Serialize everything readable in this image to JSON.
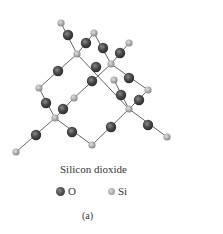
{
  "figure": {
    "title": "Silicon dioxide",
    "panel_label": "(a)",
    "legend": [
      {
        "symbol": "O",
        "label": "O",
        "color": "#4a4a4a"
      },
      {
        "symbol": "Si",
        "label": "Si",
        "color": "#a8a8a8"
      }
    ]
  },
  "atoms": {
    "Si": [
      [
        61,
        23
      ],
      [
        94,
        33
      ],
      [
        129,
        43
      ],
      [
        77,
        54
      ],
      [
        111,
        64
      ],
      [
        114,
        80
      ],
      [
        39,
        88
      ],
      [
        148,
        90
      ],
      [
        74,
        98
      ],
      [
        129,
        109
      ],
      [
        55,
        118
      ],
      [
        92,
        145
      ],
      [
        167,
        137
      ],
      [
        16,
        152
      ]
    ],
    "O": [
      [
        68,
        35
      ],
      [
        86,
        43
      ],
      [
        103,
        48
      ],
      [
        120,
        53
      ],
      [
        58,
        71
      ],
      [
        96,
        67
      ],
      [
        92,
        81
      ],
      [
        129,
        78
      ],
      [
        46,
        103
      ],
      [
        63,
        109
      ],
      [
        121,
        95
      ],
      [
        139,
        100
      ],
      [
        72,
        132
      ],
      [
        111,
        127
      ],
      [
        148,
        125
      ],
      [
        36,
        135
      ]
    ]
  },
  "bonds": [
    [
      [
        61,
        23
      ],
      [
        77,
        54
      ]
    ],
    [
      [
        94,
        33
      ],
      [
        77,
        54
      ]
    ],
    [
      [
        94,
        33
      ],
      [
        111,
        64
      ]
    ],
    [
      [
        129,
        43
      ],
      [
        111,
        64
      ]
    ],
    [
      [
        77,
        54
      ],
      [
        129,
        109
      ]
    ],
    [
      [
        77,
        54
      ],
      [
        39,
        88
      ]
    ],
    [
      [
        111,
        64
      ],
      [
        74,
        98
      ]
    ],
    [
      [
        111,
        64
      ],
      [
        148,
        90
      ]
    ],
    [
      [
        114,
        80
      ],
      [
        129,
        109
      ]
    ],
    [
      [
        148,
        90
      ],
      [
        129,
        109
      ]
    ],
    [
      [
        39,
        88
      ],
      [
        55,
        118
      ]
    ],
    [
      [
        74,
        98
      ],
      [
        55,
        118
      ]
    ],
    [
      [
        55,
        118
      ],
      [
        16,
        152
      ]
    ],
    [
      [
        55,
        118
      ],
      [
        92,
        145
      ]
    ],
    [
      [
        92,
        145
      ],
      [
        129,
        109
      ]
    ],
    [
      [
        129,
        109
      ],
      [
        167,
        137
      ]
    ]
  ]
}
